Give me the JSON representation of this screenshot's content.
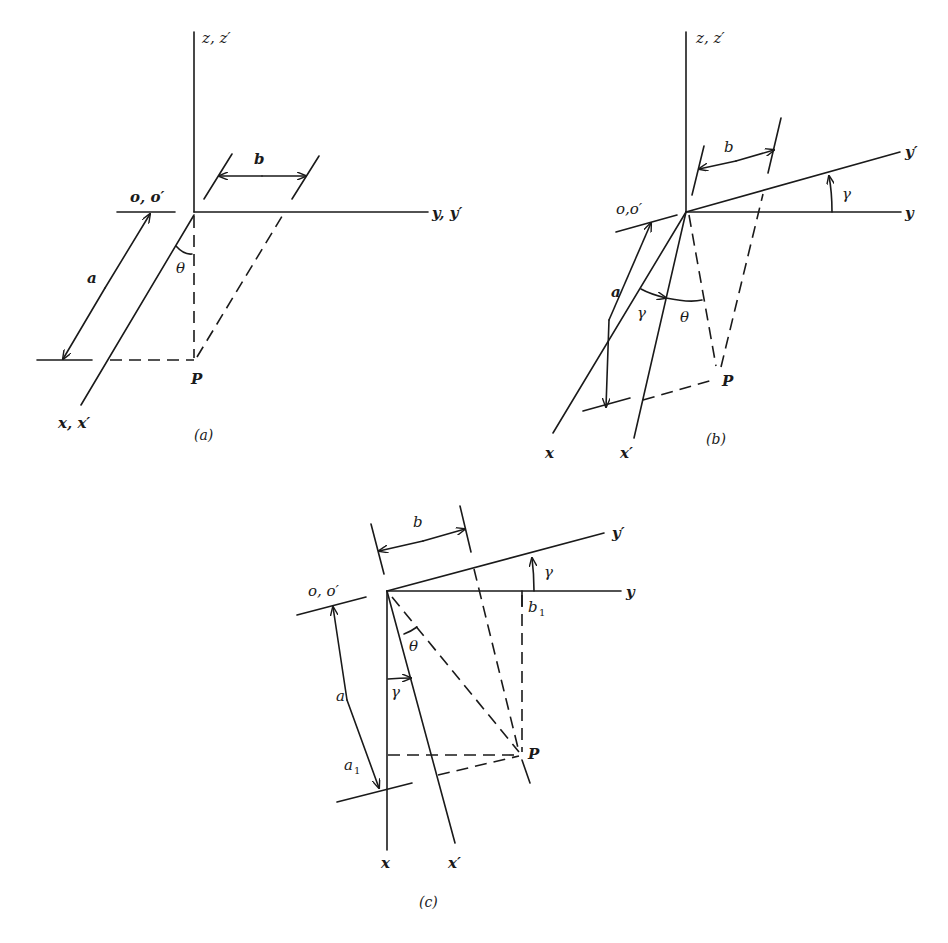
{
  "figure": {
    "panels": [
      {
        "id": "a",
        "caption": "(a)",
        "labels": {
          "z_axis": "z, z′",
          "y_axis": "y, y′",
          "x_axis": "x, x′",
          "origin": "o, o′",
          "dim_a": "a",
          "dim_b": "b",
          "angle_theta": "θ",
          "point": "P"
        }
      },
      {
        "id": "b",
        "caption": "(b)",
        "labels": {
          "z_axis": "z, z′",
          "y_axis": "y",
          "y_prime_axis": "y′",
          "x_axis": "x",
          "x_prime_axis": "x′",
          "origin": "o,o′",
          "dim_a": "a",
          "dim_b": "b",
          "angle_gamma_top": "γ",
          "angle_gamma_left": "γ",
          "angle_theta": "θ",
          "point": "P"
        }
      },
      {
        "id": "c",
        "caption": "(c)",
        "labels": {
          "y_axis": "y",
          "y_prime_axis": "y′",
          "x_axis": "x",
          "x_prime_axis": "x′",
          "origin": "o, o′",
          "dim_a": "a",
          "dim_a1": "a",
          "dim_a1_sub": "1",
          "dim_b": "b",
          "dim_b1": "b",
          "dim_b1_sub": "1",
          "angle_gamma_top": "γ",
          "angle_gamma_left": "γ",
          "angle_theta": "θ",
          "point": "P"
        }
      }
    ]
  }
}
